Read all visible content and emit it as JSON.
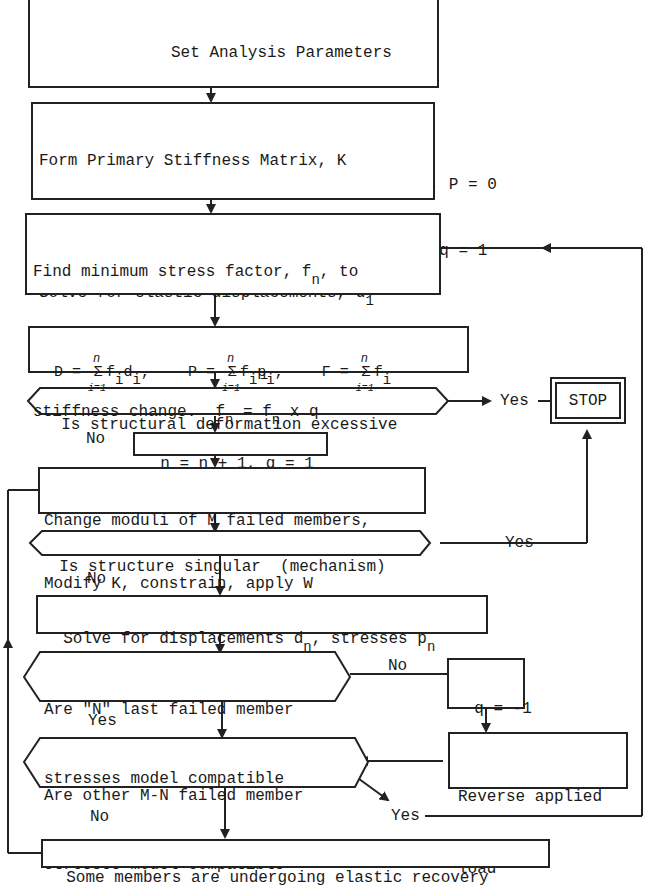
{
  "diagram": {
    "type": "flowchart",
    "nodes": {
      "set_params": {
        "lines": [
          "Set Analysis Parameters",
          "No. of analysis steps, n = 1",
          "Joint Deflections, D = 0, Member Stresses, P = 0",
          "Load Factor, F = 0, Step Load Multiplier, q = 1"
        ]
      },
      "form_stiffness": {
        "line1": "Form Primary Stiffness Matrix, K",
        "line2": "Constrain K, apply external load W",
        "line3": "Solve for elastic displacements, d",
        "line3_sub": "1",
        "line4": "and elastic stresses, P",
        "line4_sub": "1"
      },
      "find_min_stress": {
        "line1_a": "Find minimum stress factor, f",
        "line1_sub": "n",
        "line1_b": ", to",
        "line2": "cause next member to reach a",
        "line3_a": "stiffness change.  f",
        "line3_sub1": "n",
        "line3_b": " = f",
        "line3_sub2": "n",
        "line3_c": " x q"
      },
      "summation": {
        "d_lhs": "D = ",
        "d_term": "f",
        "d_sub1": "i",
        "d_term2": "d",
        "d_sub2": "i",
        "d_comma": ",",
        "p_lhs": "P = ",
        "p_term": "f",
        "p_sub1": "i",
        "p_term2": "p",
        "p_sub2": "i",
        "p_comma": ",",
        "f_lhs": "F = ",
        "f_term": "f",
        "f_sub": "i",
        "sigma": "Σ",
        "upper": "n",
        "lower": "i=1"
      },
      "deformation_check": {
        "text": "Is structural deformation excessive"
      },
      "stop": {
        "text": "STOP"
      },
      "increment": {
        "text": "n = n + 1, q = 1"
      },
      "change_moduli": {
        "line1": "Change moduli of M failed members,",
        "line2": "Modify K, constrain, apply W"
      },
      "singular_check": {
        "text": "Is structure singular  (mechanism)"
      },
      "solve_displacements": {
        "text_a": "Solve for displacements d",
        "sub1": "n",
        "text_b": ", stresses p",
        "sub2": "n"
      },
      "last_failed_check": {
        "line1": "Are \"N\" last failed member",
        "line2": "stresses model compatible"
      },
      "q_reverse": {
        "text": "q = -1"
      },
      "other_failed_check": {
        "line1": "Are other M-N failed member",
        "line2": "stresses model compatible"
      },
      "reverse_load": {
        "line1": "Reverse applied",
        "line2": "load"
      },
      "elastic_recovery": {
        "text": "Some members are undergoing elastic recovery"
      }
    },
    "edge_labels": {
      "deformation_yes": "Yes",
      "deformation_no": "No",
      "singular_yes": "Yes",
      "singular_no": "No",
      "last_failed_no": "No",
      "last_failed_yes": "Yes",
      "other_failed_yes": "Yes",
      "other_failed_no": "No"
    },
    "colors": {
      "line": "#222222",
      "background": "#ffffff",
      "text": "#1a1a1a"
    }
  }
}
